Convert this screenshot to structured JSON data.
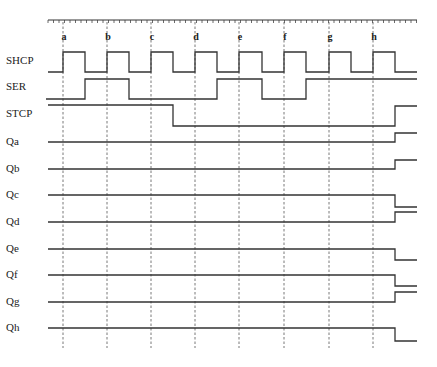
{
  "diagram": {
    "colors": {
      "line": "#333333",
      "background": "#ffffff"
    },
    "ruler": {
      "x_start": 48,
      "x_end": 417,
      "y": 20,
      "tick_spacing": 5.5
    },
    "markers": [
      {
        "label": "a",
        "x": 63
      },
      {
        "label": "b",
        "x": 107
      },
      {
        "label": "c",
        "x": 151
      },
      {
        "label": "d",
        "x": 195
      },
      {
        "label": "e",
        "x": 239
      },
      {
        "label": "f",
        "x": 284
      },
      {
        "label": "g",
        "x": 329
      },
      {
        "label": "h",
        "x": 373
      }
    ],
    "dash_y_start": 22,
    "dash_y_end": 348,
    "signals": [
      {
        "name": "SHCP",
        "label_y": 64,
        "points": "48,72 63,72 63,52 85,52 85,72 107,72 107,52 129,52 129,72 151,72 151,52 173,52 173,72 195,72 195,52 217,52 217,72 239,72 239,52 262,52 262,72 284,72 284,52 306,52 306,72 329,72 329,52 351,52 351,72 373,72 373,52 395,52 395,72 417,72"
      },
      {
        "name": "SER",
        "label_y": 90,
        "points": "46,99 85,99 85,79 129,79 129,99 217,99 217,79 262,79 262,99 306,99 306,79 417,79"
      },
      {
        "name": "STCP",
        "label_y": 117,
        "points": "48,105 173,105 173,126 395,126 395,106 417,106"
      },
      {
        "name": "Qa",
        "label_y": 145,
        "points": "48,142 395,142 395,133 417,133"
      },
      {
        "name": "Qb",
        "label_y": 172,
        "points": "48,169 395,169 395,160 417,160"
      },
      {
        "name": "Qc",
        "label_y": 198,
        "points": "48,195 395,195 395,207 417,207"
      },
      {
        "name": "Qd",
        "label_y": 225,
        "points": "48,222 395,222 395,212 417,212"
      },
      {
        "name": "Qe",
        "label_y": 252,
        "points": "48,249 395,249 395,260 417,260"
      },
      {
        "name": "Qf",
        "label_y": 278,
        "points": "48,275 395,275 395,286 417,286"
      },
      {
        "name": "Qg",
        "label_y": 305,
        "points": "48,302 395,302 395,292 417,292"
      },
      {
        "name": "Qh",
        "label_y": 331,
        "points": "48,328 395,328 395,341 417,341"
      }
    ]
  }
}
